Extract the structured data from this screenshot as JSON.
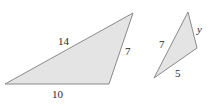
{
  "figure": {
    "colors": {
      "fill": "#e4e4e4",
      "stroke": "#8a8a8a",
      "text": "#2a2a2a"
    },
    "triangles": [
      {
        "id": "large",
        "vertices": [
          [
            5,
            84
          ],
          [
            133,
            13
          ],
          [
            109,
            84
          ]
        ],
        "labels": {
          "long_side": "14",
          "right_side": "7",
          "bottom_side": "10"
        }
      },
      {
        "id": "small",
        "vertices": [
          [
            154,
            78
          ],
          [
            188,
            12
          ],
          [
            197,
            48
          ]
        ],
        "labels": {
          "left_side": "7",
          "right_side": "y",
          "bottom_side": "5"
        }
      }
    ]
  }
}
